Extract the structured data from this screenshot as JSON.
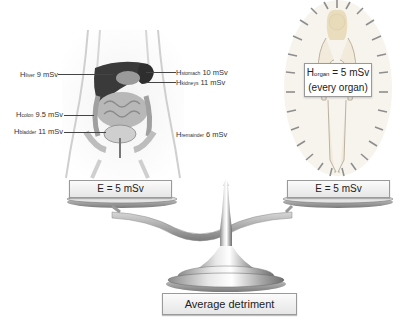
{
  "left_panel": {
    "labels": [
      {
        "symbol": "H",
        "sub": "liver",
        "value": "9 mSv"
      },
      {
        "symbol": "H",
        "sub": "stomach",
        "value": "10 mSv"
      },
      {
        "symbol": "H",
        "sub": "kidneys",
        "value": "11 mSv"
      },
      {
        "symbol": "H",
        "sub": "colon",
        "value": "9.5 mSv"
      },
      {
        "symbol": "H",
        "sub": "bladder",
        "value": "11 mSv"
      },
      {
        "symbol": "H",
        "sub": "remainder",
        "value": "6 mSv"
      }
    ],
    "effective_dose": "E = 5 mSv"
  },
  "right_panel": {
    "organ_dose_symbol": "H",
    "organ_dose_sub": "organ",
    "organ_dose_value": " = 5 mSv",
    "organ_dose_note": "(every organ)",
    "effective_dose": "E = 5 mSv"
  },
  "base_label": "Average detriment",
  "colors": {
    "organs_dark": "#3a3a3a",
    "organs_mid": "#8c8c8c",
    "body_outline": "#c8c8c8",
    "arrow": "#888888",
    "scale_metal": "#b5b5b5"
  }
}
